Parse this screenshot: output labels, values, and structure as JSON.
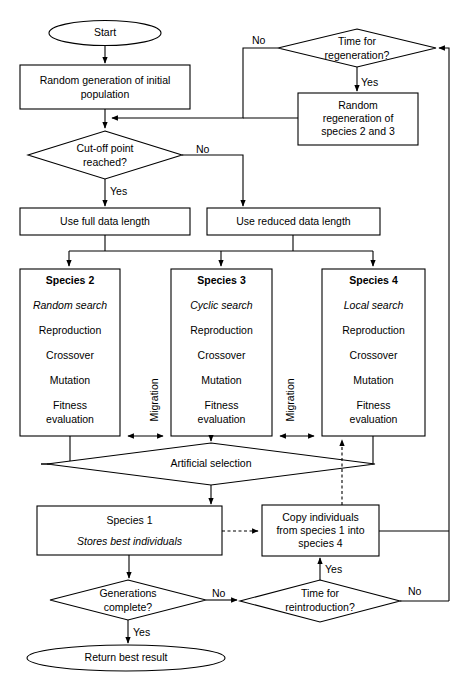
{
  "diagram": {
    "nodes": {
      "start": "Start",
      "random_generation": "Random generation of initial population",
      "cutoff": "Cut-off point reached?",
      "time_regeneration": "Time for regeneration?",
      "random_regeneration": "Random regeneration of species 2 and 3",
      "use_full": "Use full data length",
      "use_reduced": "Use reduced data length",
      "artificial_selection": "Artificial selection",
      "species1_title": "Species 1",
      "species1_sub": "Stores best individuals",
      "copy_individuals": "Copy individuals from species 1 into species 4",
      "generations_complete": "Generations complete?",
      "time_reintroduction": "Time for reintroduction?",
      "return_best": "Return best result"
    },
    "species": [
      {
        "id": "species-2",
        "title": "Species 2",
        "search": "Random search",
        "steps": [
          "Reproduction",
          "Crossover",
          "Mutation",
          "Fitness evaluation"
        ]
      },
      {
        "id": "species-3",
        "title": "Species 3",
        "search": "Cyclic search",
        "steps": [
          "Reproduction",
          "Crossover",
          "Mutation",
          "Fitness evaluation"
        ]
      },
      {
        "id": "species-4",
        "title": "Species 4",
        "search": "Local search",
        "steps": [
          "Reproduction",
          "Crossover",
          "Mutation",
          "Fitness evaluation"
        ]
      }
    ],
    "migration_labels": [
      "Migration",
      "Migration"
    ],
    "edge_labels": {
      "regen_no": "No",
      "regen_yes": "Yes",
      "cutoff_no": "No",
      "cutoff_yes": "Yes",
      "generations_no": "No",
      "generations_yes": "Yes",
      "reintro_yes": "Yes",
      "reintro_no": "No"
    },
    "multiline": {
      "random_generation": [
        "Random generation of initial",
        "population"
      ],
      "cutoff": [
        "Cut-off point",
        "reached?"
      ],
      "time_regeneration": [
        "Time for",
        "regeneration?"
      ],
      "random_regeneration": [
        "Random",
        "regeneration of",
        "species 2 and 3"
      ],
      "copy_individuals": [
        "Copy individuals",
        "from species 1 into",
        "species 4"
      ],
      "generations_complete": [
        "Generations",
        "complete?"
      ],
      "time_reintroduction": [
        "Time for",
        "reintroduction?"
      ],
      "fitness": [
        "Fitness",
        "evaluation"
      ]
    },
    "colors": {
      "stroke": "#000000",
      "fill": "#ffffff",
      "background": "#ffffff"
    }
  }
}
